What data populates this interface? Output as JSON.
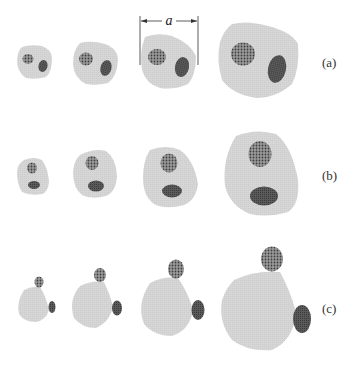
{
  "figure": {
    "dimension_label": "a",
    "colors": {
      "body": "#d3d3d3",
      "stippled_inclusion": "#8a8a8a",
      "stipple_dot": "#4a4a4a",
      "dark_inclusion": "#555555",
      "dimension_line": "#333333",
      "text": "#333333"
    },
    "rows": [
      {
        "label": "(a)",
        "case": "both inclusions remain inside the growing body",
        "stages": 4
      },
      {
        "label": "(b)",
        "case": "both inclusions inside, stacked vertically",
        "stages": 4
      },
      {
        "label": "(c)",
        "case": "inclusions pushed to the boundary, sitting outside the body",
        "stages": 4
      }
    ]
  }
}
